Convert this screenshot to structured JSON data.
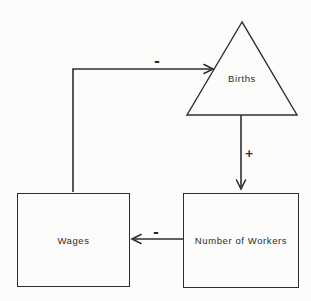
{
  "diagram": {
    "nodes": {
      "births": {
        "label": "Births",
        "shape": "triangle"
      },
      "wages": {
        "label": "Wages",
        "shape": "rectangle"
      },
      "workers": {
        "label": "Number of Workers",
        "shape": "rectangle"
      }
    },
    "edges": [
      {
        "from": "wages",
        "to": "births",
        "sign": "-"
      },
      {
        "from": "births",
        "to": "workers",
        "sign": "+"
      },
      {
        "from": "workers",
        "to": "wages",
        "sign": "-"
      }
    ],
    "colors": {
      "line": "#2e2e2e",
      "text": "#2b2b2b",
      "background": "#fcfcfa"
    }
  }
}
